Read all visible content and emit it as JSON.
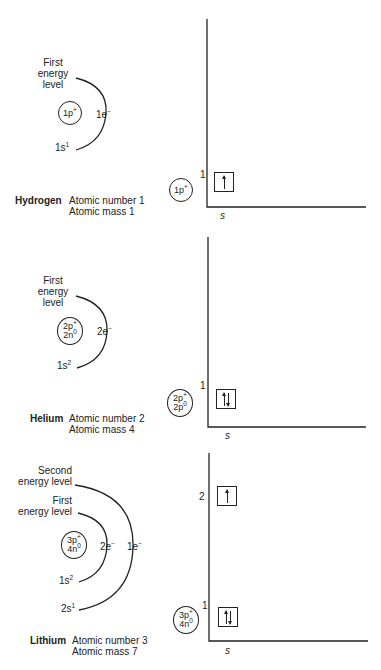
{
  "atoms": [
    {
      "name": "Hydrogen",
      "atomic_number_label": "Atomic number 1",
      "atomic_mass_label": "Atomic mass 1",
      "bohr": {
        "nucleus": [
          "1p",
          "+"
        ],
        "levels": [
          {
            "label_line1": "First",
            "label_line2": "energy",
            "label_line3": "level",
            "electrons": "1e",
            "electrons_sup": "−",
            "orbital": "1s",
            "orbital_sup": "1"
          }
        ]
      },
      "energy_diagram": {
        "nucleus": [
          "1p",
          "+"
        ],
        "level_labels": [
          "1"
        ],
        "orbitals": [
          {
            "level": 1,
            "spins": [
              "up"
            ]
          }
        ],
        "x_axis_label": "s"
      }
    },
    {
      "name": "Helium",
      "atomic_number_label": "Atomic number 2",
      "atomic_mass_label": "Atomic mass 4",
      "bohr": {
        "nucleus": [
          "2p",
          "+",
          "2n",
          "0"
        ],
        "levels": [
          {
            "label_line1": "First",
            "label_line2": "energy",
            "label_line3": "level",
            "electrons": "2e",
            "electrons_sup": "−",
            "orbital": "1s",
            "orbital_sup": "2"
          }
        ]
      },
      "energy_diagram": {
        "nucleus": [
          "2p",
          "+",
          "2p",
          "0"
        ],
        "level_labels": [
          "1"
        ],
        "orbitals": [
          {
            "level": 1,
            "spins": [
              "up",
              "down"
            ]
          }
        ],
        "x_axis_label": "s"
      }
    },
    {
      "name": "Lithium",
      "atomic_number_label": "Atomic number 3",
      "atomic_mass_label": "Atomic mass 7",
      "bohr": {
        "nucleus": [
          "3p",
          "+",
          "4n",
          "0"
        ],
        "levels": [
          {
            "label_line1": "First",
            "label_line2": "energy level",
            "electrons": "2e",
            "electrons_sup": "−",
            "orbital": "1s",
            "orbital_sup": "2"
          },
          {
            "label_line1": "Second",
            "label_line2": "energy level",
            "electrons": "1e",
            "electrons_sup": "−",
            "orbital": "2s",
            "orbital_sup": "1"
          }
        ]
      },
      "energy_diagram": {
        "nucleus": [
          "3p",
          "+",
          "4n",
          "0"
        ],
        "level_labels": [
          "1",
          "2"
        ],
        "orbitals": [
          {
            "level": 1,
            "spins": [
              "up",
              "down"
            ]
          },
          {
            "level": 2,
            "spins": [
              "up"
            ]
          }
        ],
        "x_axis_label": "s"
      }
    }
  ]
}
